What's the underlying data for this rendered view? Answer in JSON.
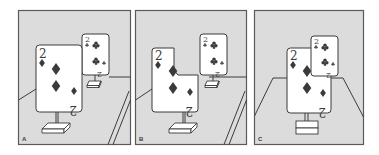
{
  "figure": {
    "colors": {
      "background": "#dcdcdc",
      "ink": "#3a3a3a",
      "card": "#ffffff",
      "border": "#5a5a5a"
    },
    "panels": [
      {
        "label": "A",
        "large_card": {
          "rank": "2",
          "suit": "diamonds"
        },
        "small_card": {
          "rank": "2",
          "suit": "clubs"
        },
        "arrangement": "cards separate, large card near, small card far"
      },
      {
        "label": "B",
        "large_card": {
          "rank": "2",
          "suit": "diamonds"
        },
        "small_card": {
          "rank": "2",
          "suit": "clubs"
        },
        "arrangement": "large card notched so small card appears to occlude it"
      },
      {
        "label": "C",
        "large_card": {
          "rank": "2",
          "suit": "diamonds"
        },
        "small_card": {
          "rank": "2",
          "suit": "clubs"
        },
        "arrangement": "small card overlapping in front of large card, frontal table view"
      }
    ]
  }
}
